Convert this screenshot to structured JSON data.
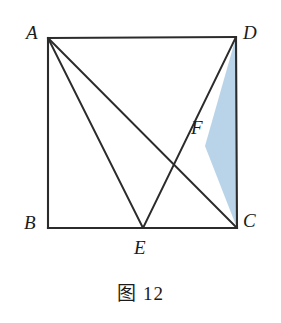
{
  "figure": {
    "caption": "图 12",
    "background_color": "#ffffff",
    "stroke_color": "#2b2b2b",
    "shade_color": "#b9d4e8",
    "shade_stroke_color": "#2b2b2b",
    "canvas": {
      "width": 281,
      "height": 323
    }
  },
  "labels": {
    "A": "A",
    "B": "B",
    "C": "C",
    "D": "D",
    "E": "E",
    "F": "F"
  },
  "chart_data": {
    "type": "diagram",
    "title": "图 12",
    "points": {
      "A": {
        "x": 48,
        "y": 38
      },
      "B": {
        "x": 48,
        "y": 228
      },
      "C": {
        "x": 237,
        "y": 228
      },
      "D": {
        "x": 236,
        "y": 37
      },
      "E": {
        "x": 143,
        "y": 228
      },
      "F": {
        "x": 205,
        "y": 146
      }
    },
    "square_outline": [
      "A",
      "D",
      "C",
      "B"
    ],
    "segments": [
      {
        "name": "AB",
        "from": "A",
        "to": "B"
      },
      {
        "name": "AD",
        "from": "A",
        "to": "D"
      },
      {
        "name": "DC",
        "from": "D",
        "to": "C"
      },
      {
        "name": "BC",
        "from": "B",
        "to": "C"
      },
      {
        "name": "AE",
        "from": "A",
        "to": "E"
      },
      {
        "name": "AC",
        "from": "A",
        "to": "C"
      },
      {
        "name": "DE",
        "from": "D",
        "to": "E"
      }
    ],
    "shaded_regions": [
      {
        "name": "triangle-DFC",
        "vertices": [
          "D",
          "F",
          "C"
        ],
        "fill": "#b9d4e8"
      }
    ],
    "label_offsets": {
      "A": {
        "x": 26,
        "y": 23
      },
      "B": {
        "x": 24,
        "y": 213
      },
      "C": {
        "x": 243,
        "y": 211
      },
      "D": {
        "x": 243,
        "y": 23
      },
      "E": {
        "x": 134,
        "y": 238
      },
      "F": {
        "x": 191,
        "y": 118
      }
    }
  }
}
